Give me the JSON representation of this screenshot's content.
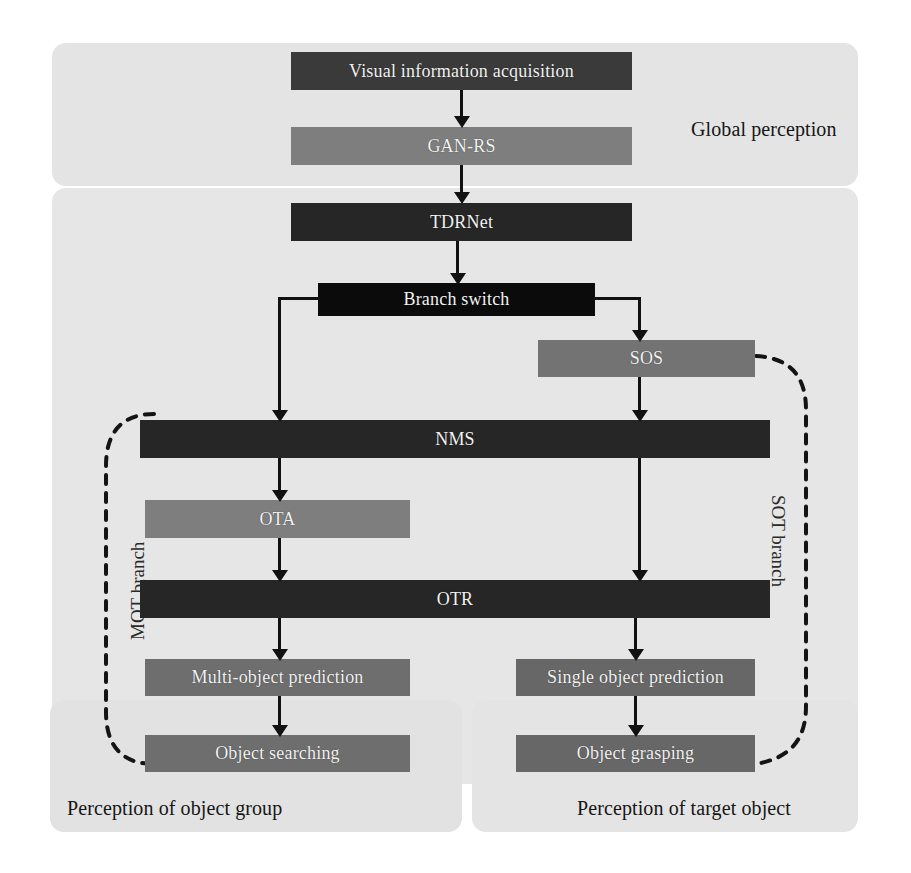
{
  "diagram": {
    "regions": [
      {
        "id": "global-perception",
        "label": "Global perception"
      },
      {
        "id": "perception-object-group",
        "label": "Perception of object group"
      },
      {
        "id": "perception-target-object",
        "label": "Perception of target object"
      }
    ],
    "branches": [
      {
        "id": "mot-branch",
        "label": "MOT branch"
      },
      {
        "id": "sot-branch",
        "label": "SOT branch"
      }
    ],
    "nodes": [
      {
        "id": "visual-information-acquisition",
        "label": "Visual information acquisition"
      },
      {
        "id": "gan-rs",
        "label": "GAN-RS"
      },
      {
        "id": "tdrnet",
        "label": "TDRNet"
      },
      {
        "id": "branch-switch",
        "label": "Branch switch"
      },
      {
        "id": "sos",
        "label": "SOS"
      },
      {
        "id": "nms",
        "label": "NMS"
      },
      {
        "id": "ota",
        "label": "OTA"
      },
      {
        "id": "otr",
        "label": "OTR"
      },
      {
        "id": "multi-object-prediction",
        "label": "Multi-object prediction"
      },
      {
        "id": "single-object-prediction",
        "label": "Single object prediction"
      },
      {
        "id": "object-searching",
        "label": "Object searching"
      },
      {
        "id": "object-grasping",
        "label": "Object grasping"
      }
    ],
    "colors": {
      "panel_background": "#e4e4e4",
      "page_background": "#ffffff",
      "box_dark": "#3a3a3a",
      "box_darker": "#262626",
      "box_black": "#0b0b0b",
      "box_mid": "#7e7e7e",
      "box_mid_dark": "#676767",
      "connector": "#111111",
      "label_text": "#161616",
      "box_text": "#f2f2f2"
    }
  }
}
